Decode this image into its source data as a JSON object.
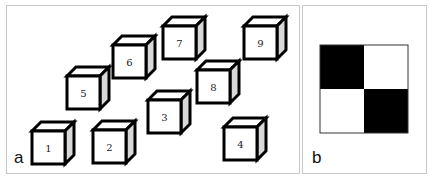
{
  "figure": {
    "panels": [
      {
        "id": "a",
        "label": "a",
        "description": "Nine numbered cubes arranged in 3D perspective",
        "cubes": [
          {
            "number": "1",
            "x": 32,
            "y": 131
          },
          {
            "number": "2",
            "x": 93,
            "y": 130
          },
          {
            "number": "3",
            "x": 148,
            "y": 100
          },
          {
            "number": "4",
            "x": 224,
            "y": 127
          },
          {
            "number": "5",
            "x": 67,
            "y": 76
          },
          {
            "number": "6",
            "x": 113,
            "y": 45
          },
          {
            "number": "7",
            "x": 163,
            "y": 26
          },
          {
            "number": "8",
            "x": 197,
            "y": 70
          },
          {
            "number": "9",
            "x": 244,
            "y": 26
          }
        ]
      },
      {
        "id": "b",
        "label": "b",
        "description": "2x2 checkerboard pattern",
        "grid": [
          [
            "black",
            "white"
          ],
          [
            "white",
            "black"
          ]
        ]
      }
    ],
    "colors": {
      "cube_front": "#ffffff",
      "cube_top": "#ffffff",
      "cube_side": "#d8d8d8",
      "edge": "#000000",
      "panel_border": "#c8c8c8",
      "checker_dark": "#000000",
      "checker_light": "#ffffff"
    }
  }
}
